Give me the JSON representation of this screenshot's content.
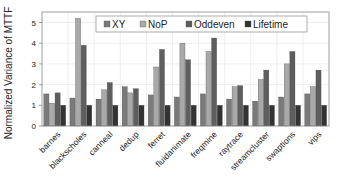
{
  "chart_data": {
    "type": "bar",
    "title": "",
    "xlabel": "",
    "ylabel": "Normalized Variance of MTTF",
    "ylim": [
      0,
      5.5
    ],
    "yticks": [
      0,
      1,
      2,
      3,
      4,
      5
    ],
    "grid": true,
    "legend_position": "top-inside",
    "categories": [
      "barnes",
      "blackscholes",
      "canneal",
      "dedup",
      "ferret",
      "fluidanimate",
      "freqmine",
      "raytrace",
      "streamcluster",
      "swaptions",
      "vips"
    ],
    "series": [
      {
        "name": "XY",
        "color": "#7a7a7a",
        "values": [
          1.55,
          1.35,
          1.3,
          1.9,
          1.5,
          1.4,
          1.55,
          1.3,
          1.2,
          1.4,
          1.55
        ]
      },
      {
        "name": "NoP",
        "color": "#a9a9a9",
        "values": [
          1.1,
          5.2,
          1.75,
          1.6,
          2.85,
          4.0,
          3.6,
          1.9,
          2.25,
          3.0,
          1.9
        ]
      },
      {
        "name": "Oddeven",
        "color": "#5e5e5e",
        "values": [
          1.6,
          3.9,
          2.1,
          1.8,
          3.7,
          3.2,
          4.25,
          1.95,
          2.7,
          3.6,
          2.7
        ]
      },
      {
        "name": "Lifetime",
        "color": "#333333",
        "values": [
          1.0,
          1.0,
          1.0,
          1.0,
          1.0,
          1.0,
          1.0,
          1.0,
          1.0,
          1.0,
          1.0
        ]
      }
    ]
  }
}
